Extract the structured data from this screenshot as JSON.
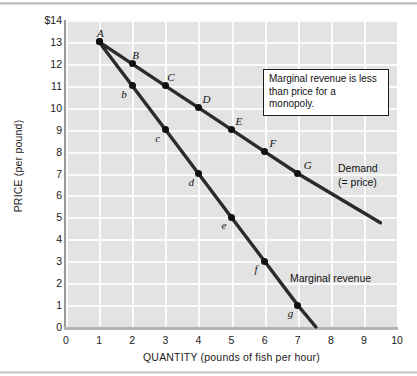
{
  "chart_data": {
    "type": "line",
    "title": "",
    "subtitle": "",
    "xlabel": "QUANTITY (pounds of fish per hour)",
    "ylabel": "PRICE (per pound)",
    "xlim": [
      0,
      10
    ],
    "ylim": [
      0,
      14
    ],
    "xticks": [
      "0",
      "1",
      "2",
      "3",
      "4",
      "5",
      "6",
      "7",
      "8",
      "9",
      "10"
    ],
    "yticks": [
      "0",
      "1",
      "2",
      "3",
      "4",
      "5",
      "6",
      "7",
      "8",
      "9",
      "10",
      "11",
      "12",
      "13",
      "$14"
    ],
    "grid": true,
    "legend_position": "inline-curve-labels",
    "series": [
      {
        "name": "Demand (= price)",
        "label_line1": "Demand",
        "label_line2": "(= price)",
        "color": "#2b2b2b",
        "x": [
          1,
          2,
          3,
          4,
          5,
          6,
          7,
          9.5
        ],
        "y": [
          13,
          12,
          11,
          10,
          9,
          8,
          7,
          4.75
        ],
        "point_labels": [
          "A",
          "B",
          "C",
          "D",
          "E",
          "F",
          "G",
          ""
        ]
      },
      {
        "name": "Marginal revenue",
        "label_line1": "Marginal revenue",
        "label_line2": "",
        "color": "#2b2b2b",
        "x": [
          1,
          2,
          3,
          4,
          5,
          6,
          7,
          7.55
        ],
        "y": [
          13,
          11,
          9,
          7,
          5,
          3,
          1,
          0
        ],
        "point_labels": [
          "A",
          "b",
          "c",
          "d",
          "e",
          "f",
          "g",
          ""
        ]
      }
    ],
    "annotations": [
      {
        "name": "monopoly-note",
        "line1": "Marginal revenue is less",
        "line2": "than price for a monopoly."
      }
    ]
  },
  "colors": {
    "plot_bg": "#e3e3e3",
    "gridline": "#fbfbfb",
    "line": "#2b2b2b",
    "marker": "#111111",
    "axis": "#9a9a9a",
    "text": "#1a1a1a",
    "annotation_bg": "#ffffff",
    "annotation_border": "#1d1d1d"
  }
}
